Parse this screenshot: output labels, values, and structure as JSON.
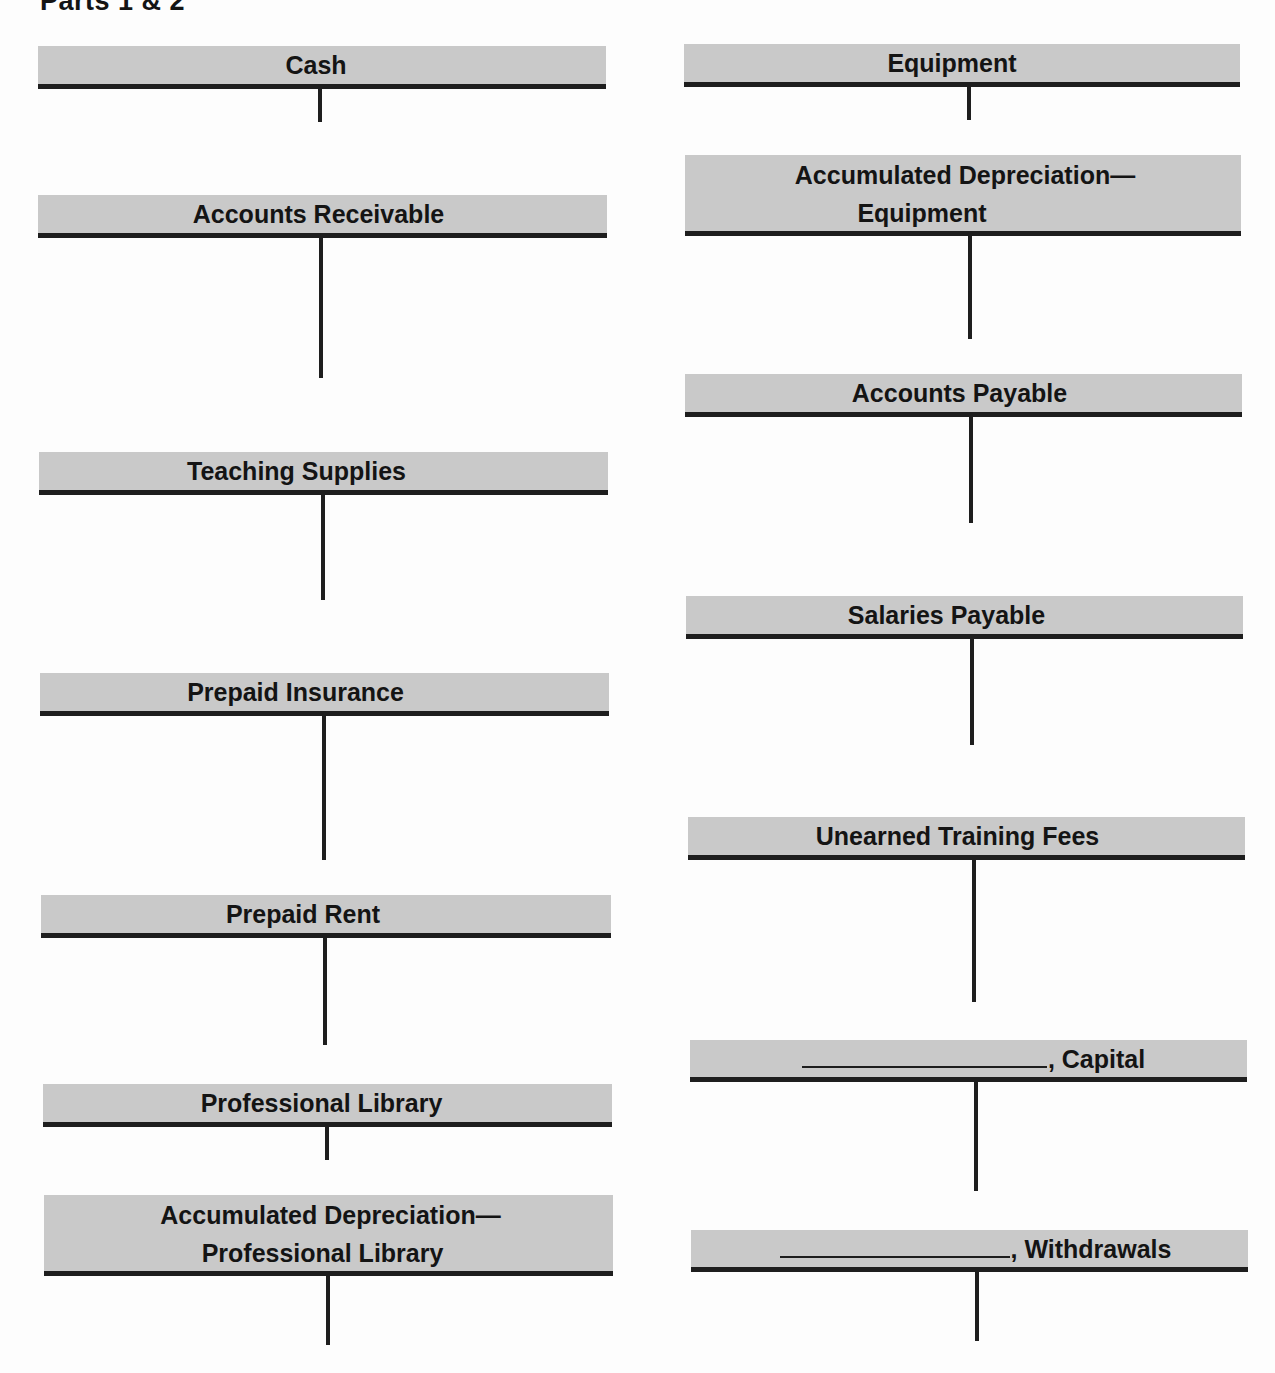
{
  "page": {
    "title": "Parts 1 & 2"
  },
  "accounts": {
    "left": [
      {
        "id": "cash",
        "title": "Cash"
      },
      {
        "id": "accounts-receivable",
        "title": "Accounts Receivable"
      },
      {
        "id": "teaching-supplies",
        "title": "Teaching Supplies"
      },
      {
        "id": "prepaid-insurance",
        "title": "Prepaid Insurance"
      },
      {
        "id": "prepaid-rent",
        "title": "Prepaid Rent"
      },
      {
        "id": "professional-library",
        "title": "Professional Library"
      },
      {
        "id": "accum-dep-professional-library",
        "title_line1": "Accumulated Depreciation—",
        "title_line2": "Professional Library"
      }
    ],
    "right": [
      {
        "id": "equipment",
        "title": "Equipment"
      },
      {
        "id": "accum-dep-equipment",
        "title_line1": "Accumulated Depreciation—",
        "title_line2": "Equipment"
      },
      {
        "id": "accounts-payable",
        "title": "Accounts Payable"
      },
      {
        "id": "salaries-payable",
        "title": "Salaries Payable"
      },
      {
        "id": "unearned-training-fees",
        "title": "Unearned Training Fees"
      },
      {
        "id": "capital",
        "blank": "",
        "suffix": ", Capital"
      },
      {
        "id": "withdrawals",
        "blank": "",
        "suffix": ", Withdrawals"
      }
    ]
  },
  "colors": {
    "header_bg": "#c9c9c9",
    "rule": "#1e1e1e",
    "text": "#141414"
  }
}
